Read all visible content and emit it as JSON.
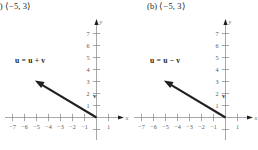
{
  "figure": {
    "type": "vector-diagram-pair",
    "panels": [
      {
        "caption": "(a)  ⟨−5, 3⟩",
        "vector_label": "u = u + v",
        "origin_label": "v",
        "axis": {
          "x_name": "x",
          "y_name": "y",
          "x_ticks": [
            "−7",
            "−6",
            "−5",
            "−4",
            "−3",
            "−2",
            "−1",
            "1"
          ],
          "x_tick_values": [
            -7,
            -6,
            -5,
            -4,
            -3,
            -2,
            -1,
            1
          ],
          "y_ticks": [
            "1",
            "2",
            "3",
            "4",
            "5",
            "6",
            "7"
          ],
          "y_tick_values": [
            1,
            2,
            3,
            4,
            5,
            6,
            7
          ],
          "xlim": [
            -7.6,
            1.7
          ],
          "ylim": [
            -1.1,
            7.7
          ]
        },
        "vector": {
          "from": [
            0,
            0
          ],
          "to": [
            -5,
            3
          ]
        }
      },
      {
        "caption": "(b)  ⟨−5, 3⟩",
        "vector_label": "u = u − v",
        "origin_label": "v",
        "axis": {
          "x_name": "x",
          "y_name": "y",
          "x_ticks": [
            "−7",
            "−6",
            "−5",
            "−4",
            "−3",
            "−2",
            "−1",
            "1"
          ],
          "x_tick_values": [
            -7,
            -6,
            -5,
            -4,
            -3,
            -2,
            -1,
            1
          ],
          "y_ticks": [
            "1",
            "2",
            "3",
            "4",
            "5",
            "6",
            "7"
          ],
          "y_tick_values": [
            1,
            2,
            3,
            4,
            5,
            6,
            7
          ],
          "xlim": [
            -7.6,
            1.7
          ],
          "ylim": [
            -1.1,
            7.7
          ]
        },
        "vector": {
          "from": [
            0,
            0
          ],
          "to": [
            -5,
            3
          ]
        }
      }
    ],
    "colors": {
      "vector": "#231f20",
      "axis": "#808285",
      "tick_text": "#58595b",
      "caption_text": "#231f20",
      "background": "#ffffff"
    }
  }
}
